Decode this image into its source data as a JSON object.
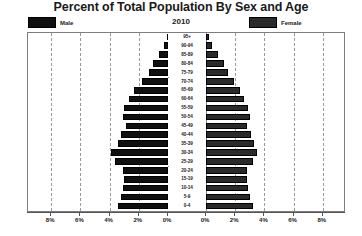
{
  "header": {
    "title": "Percent of Total Population By Sex and Age",
    "year": "2010"
  },
  "legend": {
    "male_label": "Male",
    "female_label": "Female",
    "male_color": "#101010",
    "female_color": "#2a2a2a"
  },
  "chart_data": {
    "type": "bar",
    "subtype": "population-pyramid",
    "title": "Percent of Total Population By Sex and Age",
    "subtitle": "2010",
    "xlabel": "",
    "ylabel": "",
    "xlim": [
      0,
      8
    ],
    "xticks": [
      "8%",
      "6%",
      "4%",
      "2%",
      "0%",
      "0%",
      "2%",
      "4%",
      "6%",
      "8%"
    ],
    "xtick_values": [
      8,
      6,
      4,
      2,
      0,
      0,
      2,
      4,
      6,
      8
    ],
    "grid": true,
    "legend_position": "top",
    "categories": [
      "95+",
      "90-94",
      "85-89",
      "80-84",
      "75-79",
      "70-74",
      "65-69",
      "60-64",
      "55-59",
      "50-54",
      "45-49",
      "40-44",
      "35-39",
      "30-34",
      "25-29",
      "20-24",
      "15-19",
      "10-14",
      "5-9",
      "0-4"
    ],
    "series": [
      {
        "name": "Male",
        "side": "left",
        "values": [
          0.1,
          0.3,
          0.6,
          1.0,
          1.3,
          1.8,
          2.3,
          2.7,
          3.0,
          3.1,
          2.9,
          3.2,
          3.4,
          3.9,
          3.6,
          3.1,
          3.0,
          3.1,
          3.2,
          3.4
        ]
      },
      {
        "name": "Female",
        "side": "right",
        "values": [
          0.2,
          0.4,
          0.8,
          1.2,
          1.5,
          1.9,
          2.3,
          2.6,
          2.9,
          3.0,
          2.8,
          3.1,
          3.3,
          3.5,
          3.2,
          2.8,
          2.8,
          2.9,
          3.0,
          3.2
        ]
      }
    ]
  }
}
